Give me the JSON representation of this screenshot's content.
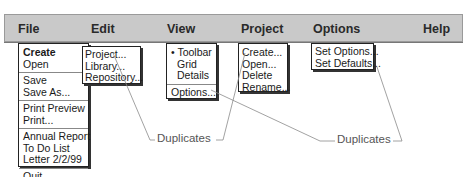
{
  "menubar": {
    "titles": [
      "File",
      "Edit",
      "View",
      "Project",
      "Options",
      "Help"
    ],
    "background": "#c9c9c9"
  },
  "file_menu": {
    "items": [
      "Create",
      "Open",
      "Save",
      "Save As...",
      "Print Preview",
      "Print...",
      "Annual Report",
      "To Do List",
      "Letter 2/2/99",
      "Quit"
    ]
  },
  "create_submenu": {
    "items": [
      "Project...",
      "Library...",
      "Repository..."
    ]
  },
  "view_menu": {
    "items": [
      "• Toolbar",
      "Grid",
      "Details",
      "Options..."
    ]
  },
  "project_menu": {
    "items": [
      "Create...",
      "Open...",
      "Delete",
      "Rename..."
    ]
  },
  "options_menu": {
    "items": [
      "Set Options...",
      "Set Defaults..."
    ]
  },
  "annotations": {
    "left_label": "Duplicates",
    "right_label": "Duplicates"
  },
  "icons": {
    "submenu_arrow": "▶"
  }
}
